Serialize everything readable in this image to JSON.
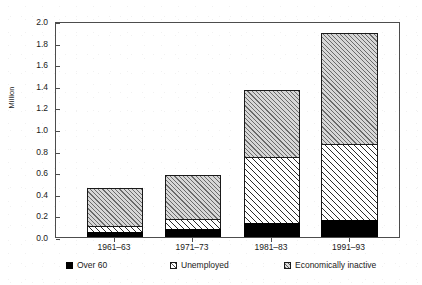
{
  "chart_data": {
    "type": "bar",
    "subtype": "stacked-vertical",
    "title": "",
    "subtitle": "",
    "xlabel": "",
    "ylabel": "Million",
    "categories": [
      "1961–63",
      "1971–73",
      "1981–83",
      "1991–93"
    ],
    "series": [
      {
        "name": "Over 60",
        "values": [
          0.05,
          0.07,
          0.13,
          0.16
        ],
        "fill": "solid-black",
        "color": "#000000"
      },
      {
        "name": "Unemployed",
        "values": [
          0.05,
          0.1,
          0.61,
          0.7
        ],
        "fill": "sparse-diagonal-hatch",
        "color": "#ffffff"
      },
      {
        "name": "Economically inactive",
        "values": [
          0.35,
          0.4,
          0.62,
          1.03
        ],
        "fill": "dense-diagonal-hatch",
        "color": "#d7d7d7"
      }
    ],
    "stack_totals": [
      0.45,
      0.57,
      1.36,
      1.89
    ],
    "segment_tops": [
      [
        0.05,
        0.1,
        0.45
      ],
      [
        0.07,
        0.17,
        0.57
      ],
      [
        0.13,
        0.74,
        1.36
      ],
      [
        0.16,
        0.86,
        1.89
      ]
    ],
    "ylim": [
      0.0,
      2.0
    ],
    "ytick_step": 0.2,
    "ytick_labels": [
      "0.0",
      "0.2",
      "0.4",
      "0.6",
      "0.8",
      "1.0",
      "1.2",
      "1.4",
      "1.6",
      "1.8",
      "2.0"
    ],
    "ytick_values": [
      0.0,
      0.2,
      0.4,
      0.6,
      0.8,
      1.0,
      1.2,
      1.4,
      1.6,
      1.8,
      2.0
    ],
    "grid": false,
    "legend_position": "bottom",
    "legend": [
      {
        "label": "Over 60",
        "swatch": "solid-black-square"
      },
      {
        "label": "Unemployed",
        "swatch": "light-hatched-square"
      },
      {
        "label": "Economically inactive",
        "swatch": "hatched-square"
      }
    ],
    "axis_frame": true,
    "annotations": []
  }
}
